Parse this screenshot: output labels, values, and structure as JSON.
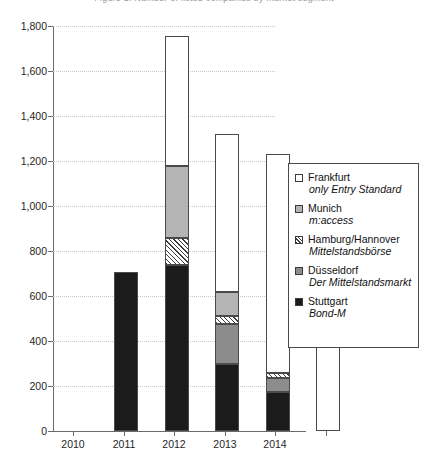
{
  "chart_data": {
    "type": "bar",
    "stacked": true,
    "title": "Figure 1: Number of listed companies by market segment",
    "categories": [
      "2010",
      "2011",
      "2012",
      "2013",
      "2014"
    ],
    "series": [
      {
        "name": "Stuttgart",
        "sub": "Bond-M",
        "color": "#1b1b1b",
        "pattern": "solid-black",
        "values": [
          705,
          740,
          300,
          175,
          0
        ]
      },
      {
        "name": "Düsseldorf",
        "sub": "Der Mittelstandsmarkt",
        "color": "#8c8c8c",
        "pattern": "solid-gray",
        "values": [
          0,
          0,
          175,
          60,
          0
        ]
      },
      {
        "name": "Hamburg/Hannover",
        "sub": "Mittelstandsbörse",
        "color": "#ffffff",
        "pattern": "hatched",
        "values": [
          0,
          120,
          37,
          25,
          0
        ]
      },
      {
        "name": "Munich",
        "sub": "m:access",
        "color": "#b4b4b4",
        "pattern": "light-gray",
        "values": [
          0,
          320,
          108,
          0,
          0
        ]
      },
      {
        "name": "Frankfurt",
        "sub": "only Entry Standard",
        "color": "#ffffff",
        "pattern": "white",
        "values": [
          0,
          575,
          700,
          970,
          435
        ]
      }
    ],
    "totals": [
      705,
      1755,
      1320,
      1230,
      435
    ],
    "xlabel": "",
    "ylabel": "",
    "ylim": [
      0,
      1800
    ],
    "yticks": [
      "0",
      "200",
      "400",
      "600",
      "800",
      "1,000",
      "1,200",
      "1,400",
      "1,600",
      "1,800"
    ],
    "ytick_values": [
      0,
      200,
      400,
      600,
      800,
      1000,
      1200,
      1400,
      1600,
      1800
    ],
    "grid": "horizontal-dotted",
    "legend_position": "right-inside",
    "legend_order": [
      "Frankfurt",
      "Munich",
      "Hamburg/Hannover",
      "Düsseldorf",
      "Stuttgart"
    ]
  },
  "legend": {
    "items": [
      {
        "name": "Frankfurt",
        "sub": "only Entry Standard",
        "swatch": "frankfurt"
      },
      {
        "name": "Munich",
        "sub": "m:access",
        "swatch": "munich"
      },
      {
        "name": "Hamburg/Hannover",
        "sub": "Mittelstandsbörse",
        "swatch": "hamburg"
      },
      {
        "name": "Düsseldorf",
        "sub": "Der Mittelstandsmarkt",
        "swatch": "dusseldorf"
      },
      {
        "name": "Stuttgart",
        "sub": "Bond-M",
        "swatch": "stuttgart"
      }
    ]
  }
}
